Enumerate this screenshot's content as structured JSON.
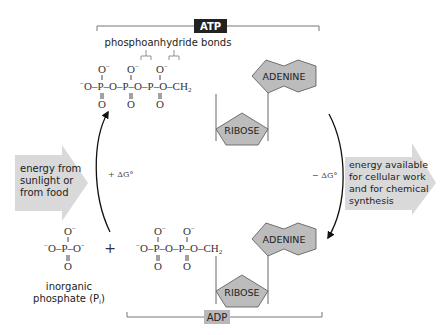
{
  "diagram": {
    "title_top": "ATP",
    "title_bottom": "ADP",
    "bond_label": "phosphoanhydride bonds",
    "left_arrow_text": [
      "energy from",
      "sunlight or",
      "from food"
    ],
    "right_arrow_text": [
      "energy available",
      "for cellular work",
      "and for chemical",
      "synthesis"
    ],
    "left_delta": "+ ΔG°",
    "right_delta": "− ΔG°",
    "adenine": "ADENINE",
    "ribose": "RIBOSE",
    "plus": "+",
    "pi_label_line1": "inorganic",
    "pi_label_line2": "phosphate (P",
    "pi_subscript": "i",
    "pi_close": ")",
    "colors": {
      "arrow_fill": "#d9d9d9",
      "atp_badge": "#222222",
      "adp_badge": "#b8b8b8",
      "shape_fill": "#bcbcbc",
      "line": "#666666"
    }
  }
}
